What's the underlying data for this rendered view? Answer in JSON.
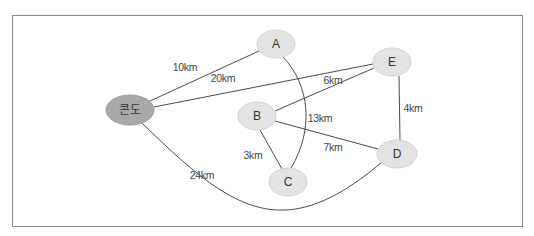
{
  "diagram": {
    "type": "weighted-graph",
    "nodes": [
      {
        "id": "condo",
        "label": "콘도",
        "cx": 130,
        "cy": 110,
        "rx": 24,
        "ry": 15,
        "style": "dark"
      },
      {
        "id": "A",
        "label": "A",
        "cx": 276,
        "cy": 44,
        "rx": 19,
        "ry": 14,
        "style": "light"
      },
      {
        "id": "B",
        "label": "B",
        "cx": 257,
        "cy": 116,
        "rx": 19,
        "ry": 14,
        "style": "light"
      },
      {
        "id": "C",
        "label": "C",
        "cx": 288,
        "cy": 182,
        "rx": 19,
        "ry": 14,
        "style": "light"
      },
      {
        "id": "D",
        "label": "D",
        "cx": 397,
        "cy": 154,
        "rx": 20,
        "ry": 14,
        "style": "light"
      },
      {
        "id": "E",
        "label": "E",
        "cx": 392,
        "cy": 62,
        "rx": 19,
        "ry": 14,
        "style": "light"
      }
    ],
    "edges": [
      {
        "from": "condo",
        "to": "A",
        "label": "10km",
        "lx": 185,
        "ly": 67
      },
      {
        "from": "condo",
        "to": "E",
        "label": "20km",
        "lx": 223,
        "ly": 78
      },
      {
        "from": "B",
        "to": "E",
        "label": "6km",
        "lx": 333,
        "ly": 80
      },
      {
        "from": "A",
        "to": "C",
        "label": "13km",
        "lx": 320,
        "ly": 118
      },
      {
        "from": "E",
        "to": "D",
        "label": "4km",
        "lx": 412,
        "ly": 108
      },
      {
        "from": "B",
        "to": "D",
        "label": "7km",
        "lx": 333,
        "ly": 147
      },
      {
        "from": "B",
        "to": "C",
        "label": "3km",
        "lx": 253,
        "ly": 155
      },
      {
        "from": "condo",
        "to": "D",
        "label": "24km",
        "lx": 202,
        "ly": 175
      }
    ]
  },
  "colors": {
    "frame_border": "#8a8a8a",
    "edge": "#4a4a4a",
    "node_light": "#e3e3e3",
    "node_dark": "#a9a9a9"
  }
}
